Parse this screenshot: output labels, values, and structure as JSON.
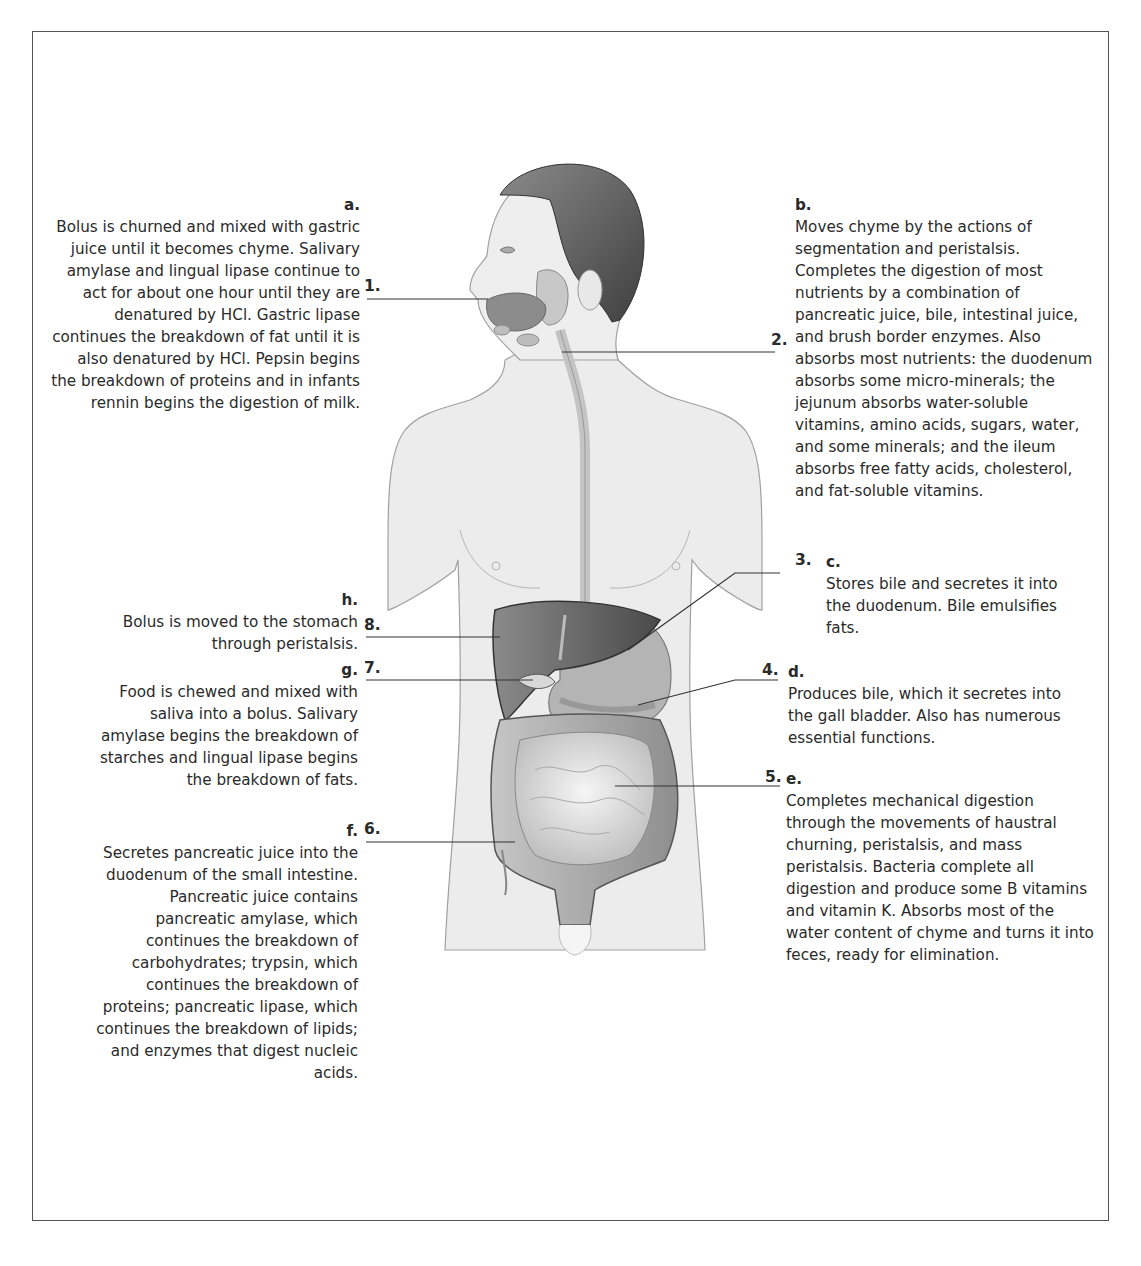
{
  "figure": {
    "title": ""
  },
  "numbers": {
    "n1": "1.",
    "n2": "2.",
    "n3": "3.",
    "n4": "4.",
    "n5": "5.",
    "n6": "6.",
    "n7": "7.",
    "n8": "8."
  },
  "descriptions": {
    "a": {
      "letter": "a.",
      "text": "Bolus is churned and mixed with gastric\njuice until it becomes chyme. Salivary\namylase and lingual lipase continue to\nact for about one hour until they are\ndenatured by HCl. Gastric lipase\ncontinues the breakdown of fat until it is\nalso denatured by HCl. Pepsin begins\nthe breakdown of proteins and in infants\nrennin begins the digestion of milk."
    },
    "b": {
      "letter": "b.",
      "text": "Moves chyme by the actions of\nsegmentation and peristalsis.\nCompletes the digestion of most\nnutrients by a combination of\npancreatic juice, bile, intestinal juice,\nand brush border enzymes. Also\nabsorbs most nutrients: the duodenum\nabsorbs some micro-minerals; the\njejunum absorbs water-soluble\nvitamins, amino acids, sugars, water,\nand some minerals; and the ileum\nabsorbs free fatty acids, cholesterol,\nand fat-soluble vitamins."
    },
    "c": {
      "letter": "c.",
      "text": "Stores bile and secretes it into\nthe duodenum. Bile emulsifies\nfats."
    },
    "d": {
      "letter": "d.",
      "text": "Produces bile, which it secretes into\nthe gall bladder. Also has numerous\nessential functions."
    },
    "e": {
      "letter": "e.",
      "text": "Completes mechanical digestion\nthrough the movements of haustral\nchurning, peristalsis, and mass\nperistalsis. Bacteria complete all\ndigestion and produce some B vitamins\nand vitamin K. Absorbs most of the\nwater content of chyme and turns it into\nfeces, ready for elimination."
    },
    "f": {
      "letter": "f.",
      "text": "Secretes pancreatic juice into the\nduodenum of the small intestine.\nPancreatic juice contains\npancreatic amylase, which\ncontinues the breakdown of\ncarbohydrates; trypsin, which\ncontinues the breakdown of\nproteins; pancreatic lipase, which\ncontinues the breakdown of lipids;\nand enzymes that digest nucleic\nacids."
    },
    "g": {
      "letter": "g.",
      "text": "Food is chewed and mixed with\nsaliva into a bolus. Salivary\namylase begins the breakdown of\nstarches and lingual lipase begins\nthe breakdown of fats."
    },
    "h": {
      "letter": "h.",
      "text": "Bolus is moved to the stomach\nthrough peristalsis."
    }
  },
  "colors": {
    "border": "#555555",
    "skin": "#ececec",
    "hair": "#5a5a5a",
    "liver": "#6e6e6e",
    "stomach": "#b4b4b4",
    "intestine": "#d6d6d6",
    "leader_line": "#333333"
  }
}
